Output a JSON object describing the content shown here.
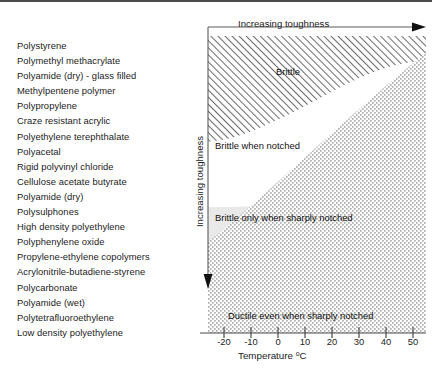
{
  "materials_list": {
    "name": "polymer-toughness-ranking",
    "items": [
      "Polystyrene",
      "Polymethyl methacrylate",
      "Polyamide (dry) - glass filled",
      "Methylpentene polymer",
      "Polypropylene",
      "Craze resistant acrylic",
      "Polyethylene terephthalate",
      "Polyacetal",
      "Rigid polyvinyl chloride",
      "Cellulose acetate butyrate",
      "Polyamide (dry)",
      "Polysulphones",
      "High density polyethylene",
      "Polyphenylene oxide",
      "Propylene-ethylene copolymers",
      "Acrylonitrile-butadiene-styrene",
      "Polycarbonate",
      "Polyamide (wet)",
      "Polytetrafluoroethylene",
      "Low density polyethylene"
    ]
  },
  "chart_data": {
    "type": "area",
    "title": "",
    "xlabel": "Temperature °C",
    "ylabel": "Increasing toughness",
    "top_axis_label": "Increasing toughness",
    "x_ticks": [
      -20,
      -10,
      0,
      10,
      20,
      30,
      40,
      50
    ],
    "x_tick_labels": [
      "-20",
      "-10",
      "0",
      "10",
      "20",
      "30",
      "40",
      "50"
    ],
    "xlim": [
      -26,
      54
    ],
    "ylim": [
      0,
      1
    ],
    "grid": false,
    "legend_position": "none",
    "regions": [
      {
        "label": "Brittle",
        "fill": "diagonal-hatch",
        "color": "#8c8c8c",
        "boundary_points": [
          {
            "x": -26,
            "y": 0.69
          },
          {
            "x": -10,
            "y": 0.73
          },
          {
            "x": 10,
            "y": 0.8
          },
          {
            "x": 30,
            "y": 0.88
          },
          {
            "x": 42,
            "y": 0.91
          },
          {
            "x": 54,
            "y": 0.915
          }
        ]
      },
      {
        "label": "Brittle when notched",
        "fill": "white",
        "color": "#ffffff",
        "boundary_points": [
          {
            "x": -26,
            "y": 0.445
          },
          {
            "x": -10,
            "y": 0.455
          },
          {
            "x": 5,
            "y": 0.49
          },
          {
            "x": 18,
            "y": 0.555
          },
          {
            "x": 28,
            "y": 0.625
          },
          {
            "x": 38,
            "y": 0.655
          },
          {
            "x": 54,
            "y": 0.665
          }
        ]
      },
      {
        "label": "Brittle only when sharply notched",
        "fill": "light-gray",
        "color": "#e8e8e8",
        "boundary_points": [
          {
            "x": -26,
            "y": 0.08
          },
          {
            "x": -10,
            "y": 0.135
          },
          {
            "x": 0,
            "y": 0.19
          },
          {
            "x": 10,
            "y": 0.255
          },
          {
            "x": 20,
            "y": 0.33
          },
          {
            "x": 30,
            "y": 0.42
          },
          {
            "x": 40,
            "y": 0.515
          },
          {
            "x": 54,
            "y": 0.63
          }
        ]
      },
      {
        "label": "Ductile even when sharply notched",
        "fill": "stipple-dots",
        "color": "#555555",
        "boundary_points": [
          {
            "x": -26,
            "y": 0.0
          },
          {
            "x": 54,
            "y": 0.0
          }
        ]
      }
    ],
    "axis_arrows": [
      {
        "name": "top-axis-arrow",
        "direction": "right"
      },
      {
        "name": "y-axis-arrow",
        "direction": "down"
      }
    ]
  }
}
